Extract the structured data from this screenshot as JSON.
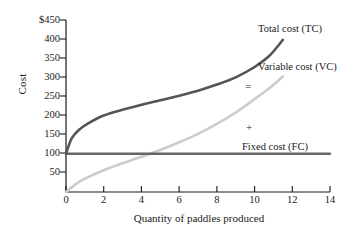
{
  "chart_data": {
    "type": "line",
    "title": "",
    "xlabel": "Quantity of paddles produced",
    "ylabel": "Cost",
    "xlim": [
      0,
      14
    ],
    "ylim": [
      0,
      450
    ],
    "grid": false,
    "legend_position": "inline-annotations",
    "xticks": [
      "0",
      "2",
      "4",
      "6",
      "8",
      "10",
      "12",
      "14"
    ],
    "xtick_values": [
      0,
      2,
      4,
      6,
      8,
      10,
      12,
      14
    ],
    "yticks": [
      "50",
      "100",
      "150",
      "200",
      "250",
      "300",
      "350",
      "400",
      "$450"
    ],
    "ytick_values": [
      50,
      100,
      150,
      200,
      250,
      300,
      350,
      400,
      450
    ],
    "series": [
      {
        "name": "Total cost (TC)",
        "short": "TC",
        "color": "#555555",
        "x": [
          0,
          0.3,
          0.7,
          1.2,
          2,
          3,
          4,
          5,
          6,
          7,
          8,
          9,
          10,
          10.8,
          11.5
        ],
        "values": [
          100,
          140,
          163,
          180,
          200,
          215,
          228,
          240,
          252,
          265,
          281,
          300,
          327,
          357,
          398
        ]
      },
      {
        "name": "Variable cost (VC)",
        "short": "VC",
        "color": "#cccccc",
        "x": [
          0,
          0.5,
          1,
          2,
          3,
          4,
          5,
          6,
          7,
          8,
          9,
          10,
          10.8,
          11.5
        ],
        "values": [
          0,
          20,
          35,
          57,
          75,
          92,
          110,
          130,
          152,
          178,
          208,
          243,
          272,
          302
        ]
      },
      {
        "name": "Fixed cost (FC)",
        "short": "FC",
        "color": "#666666",
        "x": [
          0,
          14
        ],
        "values": [
          100,
          100
        ]
      }
    ],
    "annotations": [
      {
        "text": "Total cost (TC)",
        "name": "total-cost-label",
        "x_px": 258,
        "y_px": 23
      },
      {
        "text": "Variable cost (VC)",
        "name": "variable-cost-label",
        "x_px": 258,
        "y_px": 61
      },
      {
        "text": "Fixed cost (FC)",
        "name": "fixed-cost-label",
        "x_px": 242,
        "y_px": 141
      },
      {
        "text": "=",
        "name": "equals-symbol",
        "x_px": 245,
        "y_px": 80
      },
      {
        "text": "+",
        "name": "plus-symbol",
        "x_px": 246,
        "y_px": 121
      }
    ]
  }
}
